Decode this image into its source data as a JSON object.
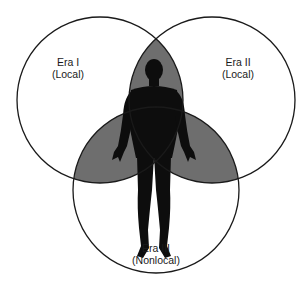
{
  "diagram": {
    "type": "venn",
    "sets": [
      {
        "id": "era1",
        "title": "Era I",
        "subtitle": "(Local)"
      },
      {
        "id": "era2",
        "title": "Era II",
        "subtitle": "(Local)"
      },
      {
        "id": "era3",
        "title": "Era III",
        "subtitle": "(Nonlocal)"
      }
    ],
    "overlap_fill": "#6e6e6e",
    "circle_stroke": "#1a1a1a",
    "figure": "human-silhouette",
    "figure_color": "#0d0d0d"
  }
}
